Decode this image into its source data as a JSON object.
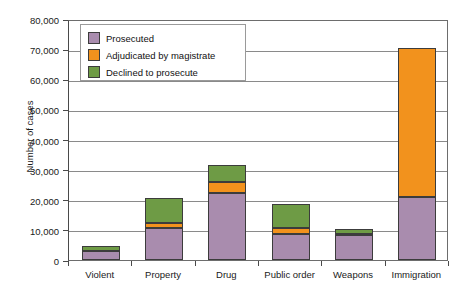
{
  "chart_data": {
    "type": "bar",
    "stacked": true,
    "title": "",
    "xlabel": "",
    "ylabel": "Number of cases",
    "ylim": [
      0,
      80000
    ],
    "ytick_step": 10000,
    "yticks": [
      "0",
      "10,000",
      "20,000",
      "30,000",
      "40,000",
      "50,000",
      "60,000",
      "70,000",
      "80,000"
    ],
    "ytick_values": [
      0,
      10000,
      20000,
      30000,
      40000,
      50000,
      60000,
      70000,
      80000
    ],
    "grid": true,
    "legend_position": "upper-left-inside",
    "categories": [
      "Violent",
      "Property",
      "Drug",
      "Public order",
      "Weapons",
      "Immigration"
    ],
    "series": [
      {
        "name": "Prosecuted",
        "color": "#a98cae",
        "values": [
          2900,
          10500,
          22300,
          8500,
          8200,
          21000
        ]
      },
      {
        "name": "Adjudicated by magistrate",
        "color": "#f2921d",
        "values": [
          200,
          1700,
          3700,
          2200,
          300,
          49500
        ]
      },
      {
        "name": "Declined to prosecute",
        "color": "#6e9b45",
        "values": [
          1700,
          8300,
          5600,
          7900,
          1900,
          0
        ]
      }
    ],
    "totals": [
      4800,
      20500,
      31600,
      18600,
      10400,
      70500
    ]
  },
  "legend": {
    "items": [
      {
        "label": "Prosecuted"
      },
      {
        "label": "Adjudicated by magistrate"
      },
      {
        "label": "Declined to prosecute"
      }
    ]
  },
  "caption": {
    "text": ""
  }
}
